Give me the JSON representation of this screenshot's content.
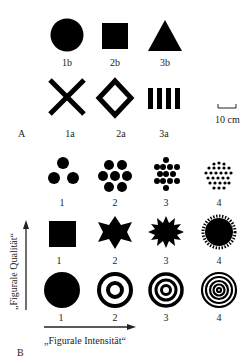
{
  "panel_a": {
    "letter": "A",
    "row_b": [
      {
        "label": "1b",
        "shape": "filled-circle"
      },
      {
        "label": "2b",
        "shape": "filled-square"
      },
      {
        "label": "3b",
        "shape": "filled-triangle"
      }
    ],
    "row_a": [
      {
        "label": "1a",
        "shape": "x-cross"
      },
      {
        "label": "2a",
        "shape": "outlined-diamond"
      },
      {
        "label": "3a",
        "shape": "four-vertical-bars"
      }
    ],
    "scale_bar": {
      "label": "10 cm"
    }
  },
  "panel_b": {
    "letter": "B",
    "rows": [
      {
        "name": "dot-clusters",
        "items": [
          {
            "label": "1",
            "shape": "3 dots"
          },
          {
            "label": "2",
            "shape": "7 dots"
          },
          {
            "label": "3",
            "shape": "15 dots"
          },
          {
            "label": "4",
            "shape": "many small dots"
          }
        ]
      },
      {
        "name": "star-shapes",
        "items": [
          {
            "label": "1",
            "shape": "square"
          },
          {
            "label": "2",
            "shape": "8-point star"
          },
          {
            "label": "3",
            "shape": "16-point star"
          },
          {
            "label": "4",
            "shape": "serrated circle"
          }
        ]
      },
      {
        "name": "concentric-rings",
        "items": [
          {
            "label": "1",
            "shape": "filled circle"
          },
          {
            "label": "2",
            "shape": "2 rings + dot"
          },
          {
            "label": "3",
            "shape": "3 rings"
          },
          {
            "label": "4",
            "shape": "5 rings"
          }
        ]
      }
    ],
    "x_axis_label": "„Figurale Intensität“",
    "y_axis_label": "„Figurale Qualität“"
  }
}
